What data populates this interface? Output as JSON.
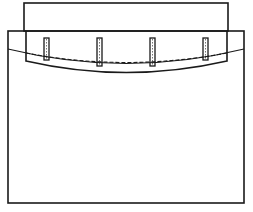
{
  "diagram": {
    "type": "technical-line-drawing",
    "stroke_color": "#1a1a1a",
    "background_color": "#ffffff",
    "components": {
      "top_panel": {
        "label": "top-panel"
      },
      "outer_frame": {
        "label": "outer-frame"
      },
      "inset_piece": {
        "label": "curved-inset-piece"
      },
      "seam_line": {
        "label": "dashed-seam-line",
        "style": "dashed"
      },
      "slots": [
        {
          "label": "slot-1"
        },
        {
          "label": "slot-2"
        },
        {
          "label": "slot-3"
        },
        {
          "label": "slot-4"
        }
      ]
    }
  }
}
